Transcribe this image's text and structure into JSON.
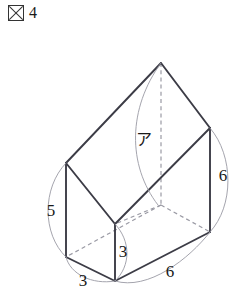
{
  "caption": {
    "icon": "figure-kanji-box",
    "label_text": "図",
    "number": "4"
  },
  "figure": {
    "part_label": "ア",
    "dimensions": [
      {
        "id": "left-height",
        "value": "5"
      },
      {
        "id": "front-height",
        "value": "3"
      },
      {
        "id": "front-depth",
        "value": "3"
      },
      {
        "id": "right-height",
        "value": "6"
      },
      {
        "id": "bottom-width",
        "value": "6"
      }
    ],
    "colors": {
      "edge": "#3c3c46",
      "hidden_edge": "#9a9aa4",
      "arc": "#9a9aa4",
      "face": "#ffffff",
      "text": "#1a1a1a"
    }
  }
}
